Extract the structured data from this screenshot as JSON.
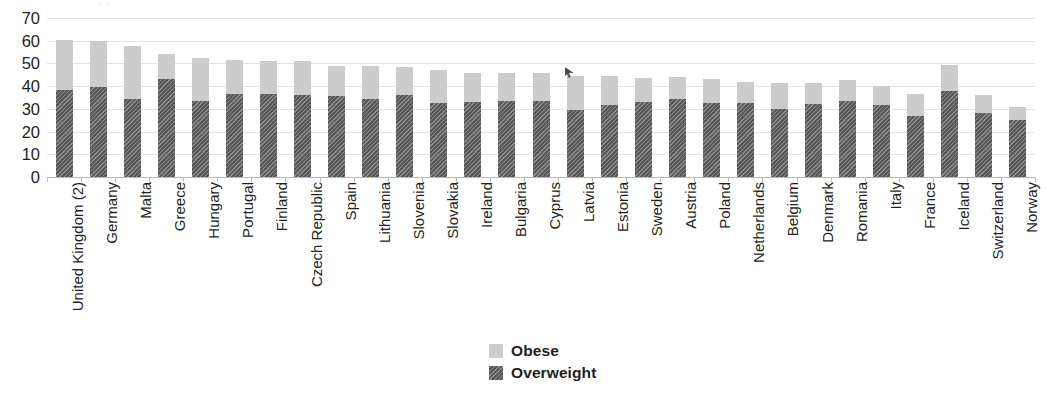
{
  "chart_data": {
    "type": "bar",
    "subtype": "stacked-vertical",
    "title": "",
    "xlabel": "",
    "ylabel": "",
    "ylim": [
      0,
      70
    ],
    "yticks": [
      0,
      10,
      20,
      30,
      40,
      50,
      60,
      70
    ],
    "grid": true,
    "legend_position": "bottom-center",
    "categories": [
      "United Kingdom (2)",
      "Germany",
      "Malta",
      "Greece",
      "Hungary",
      "Portugal",
      "Finland",
      "Czech Republic",
      "Spain",
      "Lithuania",
      "Slovenia",
      "Slovakia",
      "Ireland",
      "Bulgaria",
      "Cyprus",
      "Latvia",
      "Estonia",
      "Sweden",
      "Austria",
      "Poland",
      "Netherlands",
      "Belgium",
      "Denmark",
      "Romania",
      "Italy",
      "France",
      "Iceland",
      "Switzerland",
      "Norway"
    ],
    "series": [
      {
        "name": "Overweight",
        "color": "#595959",
        "pattern": "diagonal-hatch",
        "values": [
          38.5,
          39.5,
          34.5,
          43.0,
          33.5,
          36.5,
          36.5,
          36.0,
          35.5,
          34.5,
          36.0,
          32.5,
          33.0,
          33.5,
          33.5,
          29.5,
          31.5,
          33.0,
          34.5,
          32.5,
          32.5,
          30.0,
          32.0,
          33.5,
          31.5,
          27.0,
          38.0,
          28.0,
          25.0
        ]
      },
      {
        "name": "Obese",
        "color": "#cccccc",
        "pattern": "solid",
        "values": [
          22.0,
          20.5,
          23.0,
          11.0,
          19.0,
          15.0,
          14.5,
          15.0,
          13.5,
          14.5,
          12.5,
          14.5,
          13.0,
          12.5,
          12.5,
          15.0,
          13.0,
          10.5,
          9.5,
          10.5,
          9.5,
          11.5,
          9.5,
          9.0,
          8.5,
          9.5,
          11.5,
          8.0,
          6.0
        ]
      }
    ],
    "totals": [
      60.5,
      60.0,
      57.5,
      54.0,
      52.5,
      51.5,
      51.0,
      51.0,
      49.0,
      49.0,
      48.5,
      47.0,
      46.0,
      46.0,
      46.0,
      44.5,
      44.5,
      43.5,
      44.0,
      43.0,
      42.0,
      41.5,
      41.5,
      42.5,
      40.0,
      36.5,
      49.5,
      36.0,
      31.0
    ],
    "legend": [
      "Obese",
      "Overweight"
    ]
  },
  "axis": {
    "y_tick_labels": [
      "70",
      "60",
      "50",
      "40",
      "30",
      "20",
      "10",
      "0"
    ]
  },
  "legend": {
    "items": [
      {
        "label": "Obese",
        "key": "obese"
      },
      {
        "label": "Overweight",
        "key": "overweight"
      }
    ]
  },
  "title_crop": {
    "text": "· ·"
  }
}
